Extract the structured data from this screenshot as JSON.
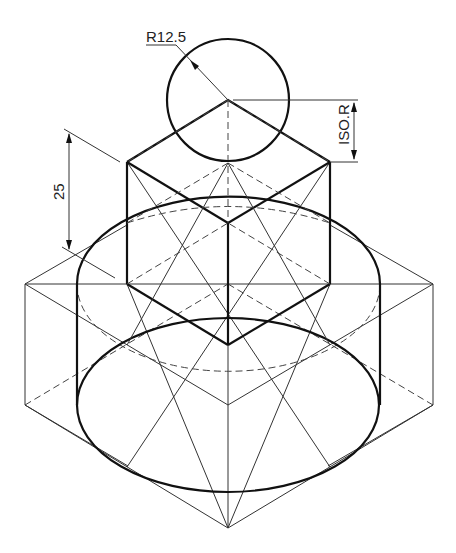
{
  "drawing": {
    "type": "isometric technical drawing",
    "annotations": {
      "radius_label": "R12.5",
      "height_label": "25",
      "iso_radius_label": "ISO.R"
    },
    "colors": {
      "line": "#111111",
      "background": "#ffffff"
    }
  }
}
